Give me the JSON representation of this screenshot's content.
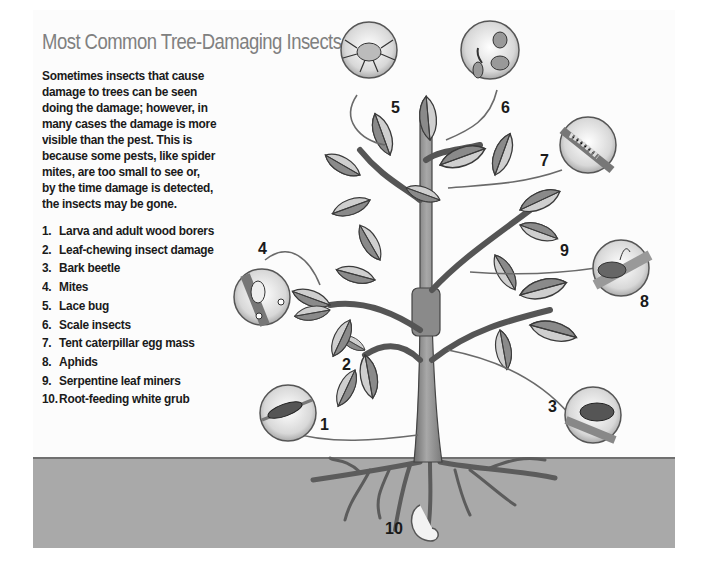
{
  "title": "Most Common Tree-Damaging Insects",
  "intro_lines": [
    "Sometimes insects that cause",
    "damage to trees can be seen",
    "doing the damage; however, in",
    "many cases the damage is more",
    "visible than the pest. This is",
    "because some pests, like spider",
    "mites, are too small to see or,",
    "by the time damage is detected,",
    "the insects may be gone."
  ],
  "legend": [
    {
      "num": "1.",
      "label": "Larva and adult wood borers"
    },
    {
      "num": "2.",
      "label": "Leaf-chewing insect damage"
    },
    {
      "num": "3.",
      "label": "Bark beetle"
    },
    {
      "num": "4.",
      "label": "Mites"
    },
    {
      "num": "5.",
      "label": "Lace bug"
    },
    {
      "num": "6.",
      "label": "Scale insects"
    },
    {
      "num": "7.",
      "label": "Tent caterpillar egg mass"
    },
    {
      "num": "8.",
      "label": "Aphids"
    },
    {
      "num": "9.",
      "label": "Serpentine leaf miners"
    },
    {
      "num": "10.",
      "label": "Root-feeding white grub"
    }
  ],
  "callout_numbers": {
    "n1": "1",
    "n2": "2",
    "n3": "3",
    "n4": "4",
    "n5": "5",
    "n6": "6",
    "n7": "7",
    "n8": "8",
    "n9": "9",
    "n10": "10"
  },
  "colors": {
    "title": "#808080",
    "text": "#1a1a1a",
    "ground": "#a9a9a9",
    "trunk": "#8c8c8c"
  }
}
